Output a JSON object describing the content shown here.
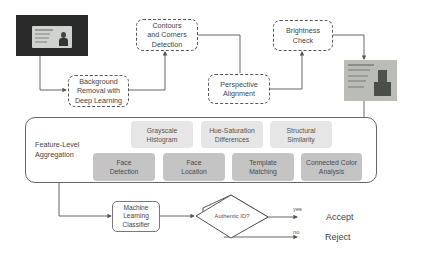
{
  "steps": {
    "background_removal": "Background Removal with Deep Learning",
    "contours": "Contours and Corners Detection",
    "perspective": "Perspective Alignment",
    "brightness": "Brightness Check"
  },
  "aggregation": {
    "title": "Feature-Level Aggregation",
    "light_features": [
      "Grayscale Histogram",
      "Hue-Saturation Differences",
      "Structural Similarity"
    ],
    "dark_features": [
      "Face Detection",
      "Face Location",
      "Template Matching",
      "Connected Color Analysis"
    ]
  },
  "classifier": {
    "label": "Machine Learning Classifier"
  },
  "decision": {
    "question": "Authentic ID?",
    "yes_label": "yes",
    "no_label": "no",
    "accept": "Accept",
    "reject": "Reject"
  },
  "images": {
    "input_id": "id-card-photo-raw",
    "processed_id": "id-card-photo-processed"
  },
  "colors": {
    "light_feature": "#e6e6e6",
    "dark_feature": "#c4c4c4",
    "line": "#555555"
  }
}
